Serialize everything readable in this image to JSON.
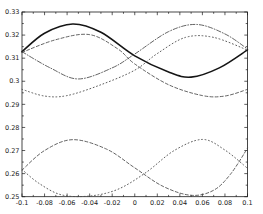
{
  "figure": {
    "background_color": "#ffffff",
    "frame_color": "#1a1a1a",
    "tick_label_color": "#1a1a1a",
    "tick_label_font_px": 6.5
  },
  "chart_data": {
    "type": "line",
    "title": "",
    "xlabel": "",
    "ylabel": "",
    "grid": false,
    "legend": "none",
    "xlim": [
      -0.1,
      0.1
    ],
    "ylim": [
      0.25,
      0.33
    ],
    "x_major_ticks": [
      -0.1,
      -0.08,
      -0.06,
      -0.04,
      -0.02,
      0,
      0.02,
      0.04,
      0.06,
      0.08,
      0.1
    ],
    "x_minor_step": 0.01,
    "xtick_labels": [
      "-0.1",
      "-0.08",
      "-0.06",
      "-0.04",
      "-0.02",
      "0",
      "0.02",
      "0.04",
      "0.06",
      "0.08",
      "0.1"
    ],
    "y_major_ticks": [
      0.25,
      0.26,
      0.27,
      0.28,
      0.29,
      0.3,
      0.31,
      0.32,
      0.33
    ],
    "y_minor_step": 0.005,
    "ytick_labels": [
      "0.25",
      "0.26",
      "0.27",
      "0.28",
      "0.29",
      "0.3",
      "0.31",
      "0.32",
      "0.33"
    ],
    "series": [
      {
        "name": "upper-solid",
        "line_style": "solid",
        "color": "#151515",
        "width": 1.6,
        "points": [
          [
            -0.1,
            0.3128
          ],
          [
            -0.08,
            0.3208
          ],
          [
            -0.055,
            0.3248
          ],
          [
            -0.03,
            0.3212
          ],
          [
            0,
            0.311
          ],
          [
            0.03,
            0.304
          ],
          [
            0.05,
            0.3018
          ],
          [
            0.075,
            0.3058
          ],
          [
            0.1,
            0.3136
          ]
        ]
      },
      {
        "name": "upper-dashdot",
        "line_style": "dashdot",
        "color": "#3c3c3c",
        "width": 0.8,
        "points": [
          [
            -0.1,
            0.3128
          ],
          [
            -0.075,
            0.3058
          ],
          [
            -0.05,
            0.301
          ],
          [
            -0.02,
            0.3058
          ],
          [
            0,
            0.3118
          ],
          [
            0.03,
            0.3215
          ],
          [
            0.055,
            0.3246
          ],
          [
            0.08,
            0.3205
          ],
          [
            0.1,
            0.314
          ]
        ]
      },
      {
        "name": "upper-dashed",
        "line_style": "dashed",
        "color": "#3c3c3c",
        "width": 0.8,
        "points": [
          [
            -0.1,
            0.3125
          ],
          [
            -0.07,
            0.318
          ],
          [
            -0.04,
            0.3202
          ],
          [
            -0.015,
            0.314
          ],
          [
            0,
            0.3075
          ],
          [
            0.03,
            0.2985
          ],
          [
            0.06,
            0.2938
          ],
          [
            0.08,
            0.2936
          ],
          [
            0.1,
            0.2965
          ]
        ]
      },
      {
        "name": "upper-dotted",
        "line_style": "dotted",
        "color": "#4a4a4a",
        "width": 0.9,
        "points": [
          [
            -0.1,
            0.2965
          ],
          [
            -0.08,
            0.2936
          ],
          [
            -0.06,
            0.2938
          ],
          [
            -0.03,
            0.2985
          ],
          [
            0,
            0.3048
          ],
          [
            0.02,
            0.312
          ],
          [
            0.045,
            0.319
          ],
          [
            0.07,
            0.319
          ],
          [
            0.1,
            0.3135
          ]
        ]
      },
      {
        "name": "lower-dashed",
        "line_style": "dashed",
        "color": "#3c3c3c",
        "width": 0.8,
        "points": [
          [
            -0.1,
            0.2615
          ],
          [
            -0.08,
            0.27
          ],
          [
            -0.055,
            0.2747
          ],
          [
            -0.025,
            0.2706
          ],
          [
            0,
            0.2625
          ],
          [
            0.025,
            0.2545
          ],
          [
            0.05,
            0.2506
          ],
          [
            0.07,
            0.2528
          ],
          [
            0.085,
            0.2598
          ],
          [
            0.1,
            0.271
          ]
        ]
      },
      {
        "name": "lower-dotted",
        "line_style": "dotted",
        "color": "#4a4a4a",
        "width": 0.9,
        "points": [
          [
            -0.1,
            0.2618
          ],
          [
            -0.085,
            0.2558
          ],
          [
            -0.065,
            0.2508
          ],
          [
            -0.04,
            0.2503
          ],
          [
            -0.015,
            0.2532
          ],
          [
            0.01,
            0.2605
          ],
          [
            0.035,
            0.27
          ],
          [
            0.06,
            0.2748
          ],
          [
            0.08,
            0.2702
          ],
          [
            0.1,
            0.2623
          ]
        ]
      }
    ]
  }
}
